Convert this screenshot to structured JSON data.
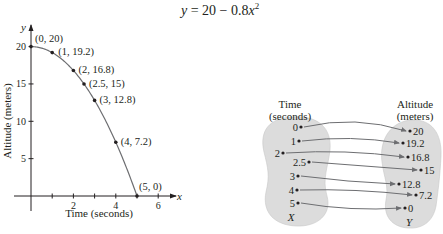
{
  "equation": {
    "lhs": "y",
    "rhs_prefix": "= 20 − 0.8",
    "var": "x",
    "exponent": "2"
  },
  "colors": {
    "ink": "#231f20",
    "blob_fill": "#dcdcdc",
    "arrow": "#6d6e71",
    "curve": "#6d6e71"
  },
  "chart_data": {
    "type": "line",
    "xlabel": "Time (seconds)",
    "ylabel": "Altitude (meters)",
    "x_axis_var": "x",
    "y_axis_var": "y",
    "xlim": [
      0,
      6.5
    ],
    "ylim": [
      0,
      21
    ],
    "x_ticks": [
      1,
      2,
      3,
      4,
      5,
      6
    ],
    "x_tick_labels": [
      "",
      "2",
      "",
      "4",
      "",
      "6"
    ],
    "y_ticks": [
      5,
      10,
      15,
      20
    ],
    "y_tick_labels": [
      "5",
      "10",
      "15",
      "20"
    ],
    "grid": false,
    "series": [
      {
        "name": "y = 20 − 0.8x²",
        "x": [
          0,
          1,
          2,
          2.5,
          3,
          4,
          5
        ],
        "y": [
          20,
          19.2,
          16.8,
          15,
          12.8,
          7.2,
          0
        ],
        "labels": [
          "(0, 20)",
          "(1, 19.2)",
          "(2, 16.8)",
          "(2.5, 15)",
          "(3, 12.8)",
          "(4, 7.2)",
          "(5, 0)"
        ]
      }
    ]
  },
  "mapping": {
    "domain_title_line1": "Time",
    "domain_title_line2": "(seconds)",
    "range_title_line1": "Altitude",
    "range_title_line2": "(meters)",
    "domain_set_label": "X",
    "range_set_label": "Y",
    "domain_values": [
      "0",
      "1",
      "2",
      "2.5",
      "3",
      "4",
      "5"
    ],
    "range_values": [
      "20",
      "19.2",
      "16.8",
      "15",
      "12.8",
      "7.2",
      "0"
    ],
    "pairs": [
      {
        "from": "0",
        "to": "20"
      },
      {
        "from": "1",
        "to": "19.2"
      },
      {
        "from": "2",
        "to": "16.8"
      },
      {
        "from": "2.5",
        "to": "15"
      },
      {
        "from": "3",
        "to": "12.8"
      },
      {
        "from": "4",
        "to": "7.2"
      },
      {
        "from": "5",
        "to": "0"
      }
    ]
  }
}
